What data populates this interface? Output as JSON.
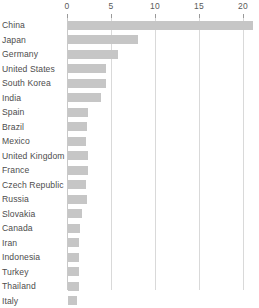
{
  "chart_data": {
    "type": "bar",
    "orientation": "horizontal",
    "title": "",
    "subtitle": "",
    "xlabel": "",
    "ylabel": "",
    "xlim": [
      0,
      20
    ],
    "xticks": [
      0,
      5,
      10,
      15,
      20
    ],
    "xtick_labels": [
      "0",
      "5",
      "10",
      "15",
      "20"
    ],
    "grid": true,
    "grid_axis": "x",
    "legend": false,
    "bar_color": "#c6c6c6",
    "gridline_color": "#d9d9d9",
    "label_color": "#4d4d4d",
    "categories": [
      "China",
      "Japan",
      "Germany",
      "United States",
      "South Korea",
      "India",
      "Spain",
      "Brazil",
      "Mexico",
      "United Kingdom",
      "France",
      "Czech Republic",
      "Russia",
      "Slovakia",
      "Canada",
      "Iran",
      "Indonesia",
      "Turkey",
      "Thailand",
      "Italy"
    ],
    "values": [
      21.0,
      8.0,
      5.7,
      4.3,
      4.3,
      3.7,
      2.3,
      2.2,
      2.1,
      2.3,
      2.3,
      2.0,
      2.2,
      1.6,
      1.4,
      1.3,
      1.3,
      1.3,
      1.3,
      1.0
    ]
  }
}
